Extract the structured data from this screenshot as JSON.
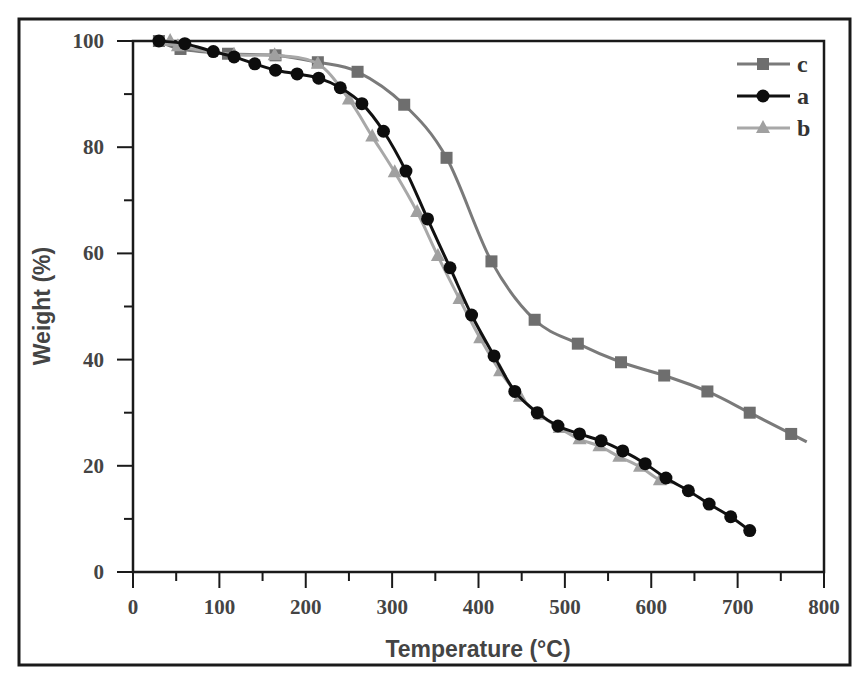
{
  "chart_data": {
    "type": "line",
    "title": "",
    "xlabel": "Temperature (°C)",
    "ylabel": "Weight (%)",
    "xlim": [
      0,
      800
    ],
    "ylim": [
      0,
      100
    ],
    "x_ticks": [
      0,
      100,
      200,
      300,
      400,
      500,
      600,
      700,
      800
    ],
    "y_ticks": [
      0,
      20,
      40,
      60,
      80,
      100
    ],
    "x_minor_step": 50,
    "y_minor_step": 10,
    "grid": false,
    "legend_position": "upper right",
    "legend": [
      "c",
      "a",
      "b"
    ],
    "series": [
      {
        "name": "c",
        "marker": "square",
        "color": "#7a7a7a",
        "x": [
          30,
          55,
          110,
          165,
          214,
          260,
          314,
          363,
          415,
          465,
          515,
          565,
          615,
          665,
          714,
          762,
          780
        ],
        "y": [
          100,
          98.5,
          97.6,
          97.3,
          96,
          94.2,
          88,
          78,
          58.5,
          47.5,
          43,
          39.5,
          37,
          34,
          30,
          26,
          24.5
        ]
      },
      {
        "name": "a",
        "marker": "circle",
        "color": "#111111",
        "x": [
          30,
          60,
          93,
          117,
          141,
          165,
          190,
          215,
          240,
          265,
          290,
          316,
          341,
          367,
          392,
          418,
          442,
          468,
          492,
          517,
          542,
          567,
          593,
          617,
          643,
          667,
          692,
          714
        ],
        "y": [
          100,
          99.5,
          98,
          97,
          95.7,
          94.5,
          93.8,
          93,
          91.2,
          88.2,
          83,
          75.5,
          66.5,
          57.3,
          48.4,
          40.7,
          34,
          30,
          27.5,
          26,
          24.7,
          22.8,
          20.4,
          17.7,
          15.3,
          12.8,
          10.4,
          7.8
        ]
      },
      {
        "name": "b",
        "marker": "triangle",
        "color": "#a8a8a8",
        "x": [
          43,
          52,
          117,
          164,
          214,
          250,
          277,
          303,
          329,
          353,
          378,
          402,
          425,
          448,
          471,
          494,
          517,
          540,
          563,
          587,
          610,
          625
        ],
        "y": [
          100,
          99,
          97.4,
          97.3,
          95.7,
          89,
          82,
          75.3,
          67.8,
          59.5,
          51.4,
          44,
          37.8,
          33,
          29.6,
          27.1,
          25,
          23.7,
          21.7,
          19.8,
          17.3,
          16.8
        ]
      }
    ]
  },
  "legend_items": [
    {
      "label": "c"
    },
    {
      "label": "a"
    },
    {
      "label": "b"
    }
  ],
  "axes": {
    "x_title": "Temperature (°C)",
    "y_title": "Weight (%)",
    "x_tick_labels": [
      "0",
      "100",
      "200",
      "300",
      "400",
      "500",
      "600",
      "700",
      "800"
    ],
    "y_tick_labels": [
      "0",
      "20",
      "40",
      "60",
      "80",
      "100"
    ]
  }
}
